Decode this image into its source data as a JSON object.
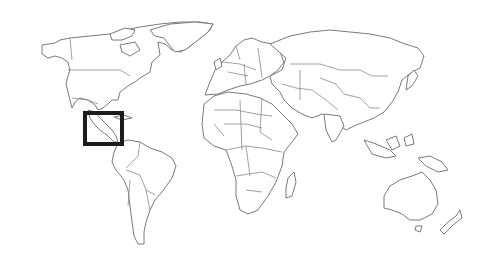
{
  "map": {
    "type": "world-outline",
    "style": "political borders, line art",
    "colors": {
      "background": "#ffffff",
      "land_fill": "#ffffff",
      "outline": "#7a7a7a",
      "highlight": "#1c1c1c"
    },
    "highlight": {
      "region": "Central America",
      "x": 83,
      "y": 111,
      "width": 41,
      "height": 35,
      "stroke_width": 4
    }
  }
}
